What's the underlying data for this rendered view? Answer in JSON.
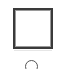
{
  "palette": {
    "items": [
      {
        "icon": "square-shape-icon",
        "label": ""
      },
      {
        "icon": "circle-shape-icon",
        "label": ""
      }
    ]
  },
  "colors": {
    "stroke": "#3a3a3a",
    "background": "#ffffff"
  }
}
